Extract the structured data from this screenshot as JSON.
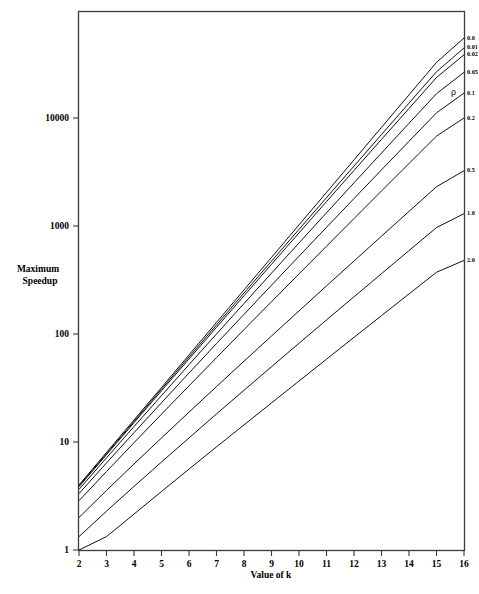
{
  "chart_data": {
    "type": "line",
    "title": "",
    "xlabel": "Value of k",
    "ylabel": "Maximum Speedup",
    "ylabel_lines": [
      "Maximum",
      "Speedup"
    ],
    "yscale": "log",
    "xscale": "linear",
    "xlim": [
      2,
      16
    ],
    "ylim": [
      1,
      70000
    ],
    "grid": false,
    "legend_position": "right-inline-labels",
    "legend_title": "ρ",
    "x": [
      2,
      3,
      4,
      5,
      6,
      7,
      8,
      9,
      10,
      11,
      12,
      13,
      14,
      15,
      16
    ],
    "xticks": [
      "2",
      "3",
      "4",
      "5",
      "6",
      "7",
      "8",
      "9",
      "10",
      "11",
      "12",
      "13",
      "14",
      "15",
      "16"
    ],
    "yticks": [
      "1",
      "10",
      "100",
      "1000",
      "10000"
    ],
    "ytick_values": [
      1,
      10,
      100,
      1000,
      10000
    ],
    "series": [
      {
        "name": "0.0",
        "label": "0.0",
        "values": [
          4.0,
          8.0,
          16.0,
          32.0,
          64.0,
          128.0,
          256.0,
          512.0,
          1024.0,
          2048.0,
          4096.0,
          8192.0,
          16384.0,
          32768.0,
          55000.0
        ]
      },
      {
        "name": "0.01",
        "label": "0.01",
        "values": [
          3.92,
          7.81,
          15.53,
          30.86,
          61.2,
          121.2,
          239.6,
          472.8,
          931.0,
          1830.0,
          3590.0,
          7030.0,
          13740.0,
          26800.0,
          44500.0
        ]
      },
      {
        "name": "0.02",
        "label": "0.02",
        "values": [
          3.85,
          7.63,
          15.08,
          29.8,
          58.7,
          115.3,
          226.0,
          442.0,
          863.0,
          1682.0,
          3270.0,
          6340.0,
          12260.0,
          23700.0,
          38500.0
        ]
      },
      {
        "name": "0.05",
        "label": "0.05",
        "values": [
          3.64,
          7.13,
          13.9,
          26.9,
          52.0,
          100.0,
          191.5,
          366.0,
          697.0,
          1325.0,
          2510.0,
          4740.0,
          8930.0,
          16780.0,
          26500.0
        ]
      },
      {
        "name": "0.1",
        "label": "0.1",
        "values": [
          3.33,
          6.4,
          12.2,
          23.1,
          43.5,
          81.5,
          152.0,
          283.0,
          525.0,
          972.0,
          1795.0,
          3310.0,
          6080.0,
          11160.0,
          17000.0
        ]
      },
      {
        "name": "0.2",
        "label": "0.2",
        "values": [
          2.86,
          5.33,
          9.85,
          18.1,
          33.1,
          60.4,
          109.8,
          199.0,
          360.0,
          650.0,
          1172.0,
          2110.0,
          3790.0,
          6800.0,
          10000.0
        ]
      },
      {
        "name": "0.5",
        "label": "0.5",
        "values": [
          2.0,
          3.56,
          6.26,
          10.9,
          18.9,
          32.6,
          56.0,
          95.8,
          163.5,
          279.0,
          474.0,
          805.0,
          1365.0,
          2310.0,
          3250.0
        ]
      },
      {
        "name": "1.0",
        "label": "1.0",
        "values": [
          1.33,
          2.29,
          3.88,
          6.53,
          10.9,
          18.2,
          30.1,
          49.8,
          82.0,
          135.0,
          221.0,
          362.0,
          592.0,
          967.0,
          1300.0
        ]
      },
      {
        "name": "2.0",
        "label": "2.0",
        "values": [
          1.0,
          1.33,
          2.15,
          3.48,
          5.61,
          9.01,
          14.4,
          23.0,
          36.7,
          58.5,
          93.1,
          148.0,
          235.0,
          373.0,
          480.0
        ]
      }
    ],
    "annotations": [
      {
        "text": "ρ",
        "role": "legend-title"
      }
    ]
  },
  "axes": {
    "x_title": "Value of k",
    "y_title_line1": "Maximum",
    "y_title_line2": "Speedup"
  }
}
